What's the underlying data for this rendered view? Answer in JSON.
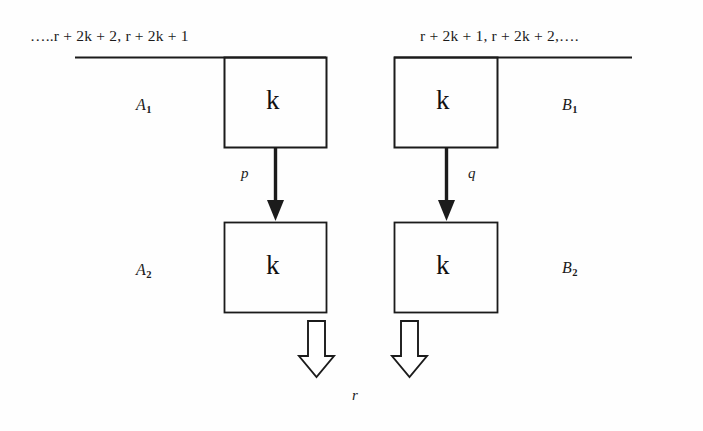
{
  "figure": {
    "background_color": "#fefefe",
    "stroke_color": "#1b1b1b"
  },
  "sequences": {
    "left": {
      "ellipsis_prefix": "…..",
      "term1": "r + 2k + 2",
      "separator": ",",
      "term2": "r + 2k + 1",
      "full": "…..r + 2k + 2, r + 2k + 1"
    },
    "right": {
      "term1": "r + 2k + 1",
      "separator": ",",
      "term2": "r + 2k + 2",
      "ellipsis_suffix": ",….",
      "full": "r + 2k + 1, r + 2k + 2,…."
    }
  },
  "regions": {
    "a1": {
      "letter": "A",
      "sub": "1"
    },
    "a2": {
      "letter": "A",
      "sub": "2"
    },
    "b1": {
      "letter": "B",
      "sub": "1"
    },
    "b2": {
      "letter": "B",
      "sub": "2"
    }
  },
  "boxes": {
    "top_left": {
      "label": "k"
    },
    "top_right": {
      "label": "k"
    },
    "bottom_left": {
      "label": "k"
    },
    "bottom_right": {
      "label": "k"
    }
  },
  "transitions": {
    "left": {
      "label": "p"
    },
    "right": {
      "label": "q"
    }
  },
  "result": {
    "label": "r"
  },
  "icons": {
    "down_arrow_solid": "down-arrow-icon",
    "down_arrow_hollow": "hollow-down-arrow-icon"
  }
}
